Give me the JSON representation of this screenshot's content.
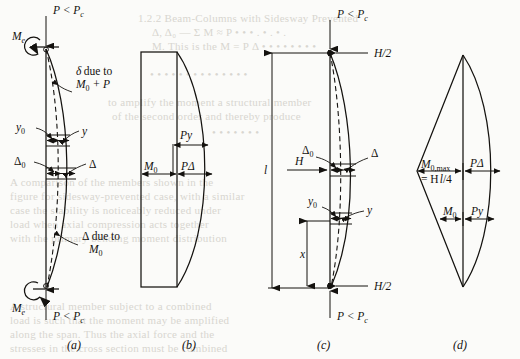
{
  "figure": {
    "panels": [
      {
        "id": "a",
        "label": "(a)",
        "caption_x": 75,
        "caption_y": 346,
        "description": "Pin-ended column with end moments Me and axial load P less than critical, showing initial and amplified deflected shapes",
        "annotations": {
          "top_load": "P < P",
          "top_load_sub": "c",
          "top_moment": "M",
          "top_moment_sub": "e",
          "bottom_load": "P < P",
          "bottom_load_sub": "c",
          "bottom_moment": "M",
          "bottom_moment_sub": "e",
          "delta_note_line1": "due to",
          "delta_note_symbol": "δ",
          "delta_note_line2": "M",
          "delta_note_line2_sub": "0",
          "delta_note_line2_tail": " + P",
          "delta_cap_note_symbol": "Δ",
          "delta_cap_note_line1": " due to",
          "delta_cap_note_line2": "M",
          "delta_cap_note_line2_sub": "0",
          "y0": "y",
          "y0_sub": "0",
          "y": "y",
          "delta0": "Δ",
          "delta0_sub": "0",
          "delta": "Δ"
        }
      },
      {
        "id": "b",
        "label": "(b)",
        "caption_x": 190,
        "caption_y": 346,
        "description": "Bending moment diagram: uniform primary moment M0 block plus curved secondary P-delta bulge",
        "annotations": {
          "m0": "M",
          "m0_sub": "0",
          "py": "Py",
          "pdelta": "PΔ"
        }
      },
      {
        "id": "c",
        "label": "(c)",
        "caption_x": 325,
        "caption_y": 346,
        "description": "Pin-ended column of length l with transverse load H applied at midheight and axial load P less than critical",
        "annotations": {
          "top_load": "P < P",
          "top_load_sub": "c",
          "bottom_load": "P < P",
          "bottom_load_sub": "c",
          "shear_top": "H/2",
          "shear_bottom": "H/2",
          "length": "l",
          "transverse_load": "H",
          "distance_x": "x",
          "y0": "y",
          "y0_sub": "0",
          "y": "y",
          "delta0": "Δ",
          "delta0_sub": "0",
          "delta": "Δ"
        }
      },
      {
        "id": "d",
        "label": "(d)",
        "caption_x": 460,
        "caption_y": 346,
        "description": "Bending moment diagram: triangular primary moment with maximum Hl/4 at midheight plus curved secondary P-delta lens",
        "annotations": {
          "m0max": "M",
          "m0max_sub": "0,max",
          "m0max_eq": "= H",
          "m0max_eq_l": "l",
          "m0max_eq_tail": "/4",
          "pdelta": "PΔ",
          "m0": "M",
          "m0_sub": "0",
          "py": "Py"
        }
      }
    ]
  },
  "background_text": [
    {
      "text": "1.2.2 Beam-Columns with Sidesway  Prevented",
      "x": 138,
      "y": 12,
      "size": 11
    },
    {
      "text": "Δ, Δ₀ — Σ M ≈ P • • • . • . • .",
      "x": 152,
      "y": 26,
      "size": 11
    },
    {
      "text": "•  •  •  •  •  •  •  •  •  •  •  •  •  •",
      "x": 150,
      "y": 68,
      "size": 11
    },
    {
      "text": "to amplify the moment  a structural member",
      "x": 108,
      "y": 96,
      "size": 11
    },
    {
      "text": "of the second order  and  thereby  produce",
      "x": 112,
      "y": 110,
      "size": 11
    },
    {
      "text": "•  •  •  •  •  •  •",
      "x": 212,
      "y": 126,
      "size": 11
    },
    {
      "text": "A comparison of the members shown in the",
      "x": 10,
      "y": 176,
      "size": 11
    },
    {
      "text": "figure for sidesway-prevented case, with a similar",
      "x": 10,
      "y": 190,
      "size": 11
    },
    {
      "text": "case the  stability  is  noticeably  reduced under",
      "x": 10,
      "y": 204,
      "size": 11
    },
    {
      "text": "load  when  axial  compression  acts  together",
      "x": 10,
      "y": 218,
      "size": 11
    },
    {
      "text": "with the primary bending moment distribution",
      "x": 10,
      "y": 232,
      "size": 11
    },
    {
      "text": "A structural member subject to a combined",
      "x": 10,
      "y": 300,
      "size": 11
    },
    {
      "text": "load is such that the moment  may  be  amplified",
      "x": 10,
      "y": 314,
      "size": 11
    },
    {
      "text": "along the span.  Thus  the  axial  force  and  the",
      "x": 10,
      "y": 328,
      "size": 11
    },
    {
      "text": "stresses in the cross section must be combined",
      "x": 10,
      "y": 342,
      "size": 11
    },
    {
      "text": "M. This  is  the  M  =  P  Δ  • • • • • • • •",
      "x": 152,
      "y": 40,
      "size": 11
    }
  ]
}
